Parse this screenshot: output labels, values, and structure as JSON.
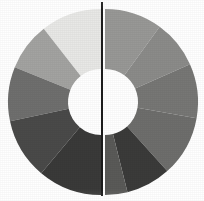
{
  "figure": {
    "background_color": "#ffffff",
    "width": 204,
    "height": 201
  },
  "divider": {
    "name": "vertical-divider",
    "color": "#1c1c1c",
    "x": 102,
    "top": 2,
    "bottom": 196,
    "thickness": 2
  },
  "geometry": {
    "center_x": 103,
    "center_y": 102,
    "outer_radius": 93,
    "inner_radius": 33,
    "gap_px": 4
  },
  "chart_data": {
    "type": "pie",
    "title": "",
    "subtitle": "",
    "xlabel": "",
    "ylabel": "",
    "grid": false,
    "legend": "none",
    "donut": true,
    "inner_radius_ratio": 0.355,
    "split": "vertical",
    "start_angle_deg": 0,
    "direction": "clockwise",
    "total": 100,
    "categories": [
      "Segment 1",
      "Segment 2",
      "Segment 3",
      "Segment 4",
      "Segment 5",
      "Segment 6",
      "Segment 7",
      "Segment 8"
    ],
    "values": [
      12.5,
      12.5,
      12.5,
      12.5,
      12.5,
      12.5,
      12.5,
      12.5
    ],
    "colors": [
      "#9a9a9a",
      "#8f8f8f",
      "#7b7b7b",
      "#3b3b3b",
      "#353535",
      "#3f3f3f",
      "#707070",
      "#d9d9d9"
    ],
    "series": [
      {
        "name": "Left half",
        "slices": [
          {
            "label": "L1",
            "start_deg": 0,
            "end_deg": 38,
            "color": "#e8e8e6",
            "tone": "very-light"
          },
          {
            "label": "L2",
            "start_deg": 38,
            "end_deg": 68,
            "color": "#a3a3a1",
            "tone": "medium-light"
          },
          {
            "label": "L3",
            "start_deg": 68,
            "end_deg": 102,
            "color": "#6f6f6e",
            "tone": "medium"
          },
          {
            "label": "L4",
            "start_deg": 102,
            "end_deg": 140,
            "color": "#4a4a49",
            "tone": "dark"
          },
          {
            "label": "L5",
            "start_deg": 140,
            "end_deg": 180,
            "color": "#3a3a39",
            "tone": "very-dark"
          }
        ]
      },
      {
        "name": "Right half",
        "slices": [
          {
            "label": "R1",
            "start_deg": 0,
            "end_deg": 36,
            "color": "#989896",
            "tone": "medium-light"
          },
          {
            "label": "R2",
            "start_deg": 36,
            "end_deg": 66,
            "color": "#8b8b89",
            "tone": "medium-light"
          },
          {
            "label": "R3",
            "start_deg": 66,
            "end_deg": 100,
            "color": "#777775",
            "tone": "medium"
          },
          {
            "label": "R4",
            "start_deg": 100,
            "end_deg": 138,
            "color": "#6e6e6c",
            "tone": "medium"
          },
          {
            "label": "R5",
            "start_deg": 138,
            "end_deg": 166,
            "color": "#3b3b3a",
            "tone": "very-dark"
          },
          {
            "label": "R6",
            "start_deg": 166,
            "end_deg": 180,
            "color": "#5a5a58",
            "tone": "dark"
          }
        ]
      }
    ],
    "annotations": []
  }
}
